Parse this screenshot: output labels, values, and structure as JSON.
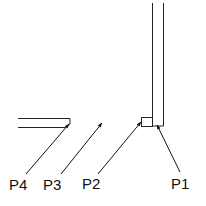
{
  "diagram": {
    "labels": {
      "p1": "P1",
      "p2": "P2",
      "p3": "P3",
      "p4": "P4"
    },
    "colors": {
      "line": "#222222",
      "background": "#ffffff"
    }
  }
}
